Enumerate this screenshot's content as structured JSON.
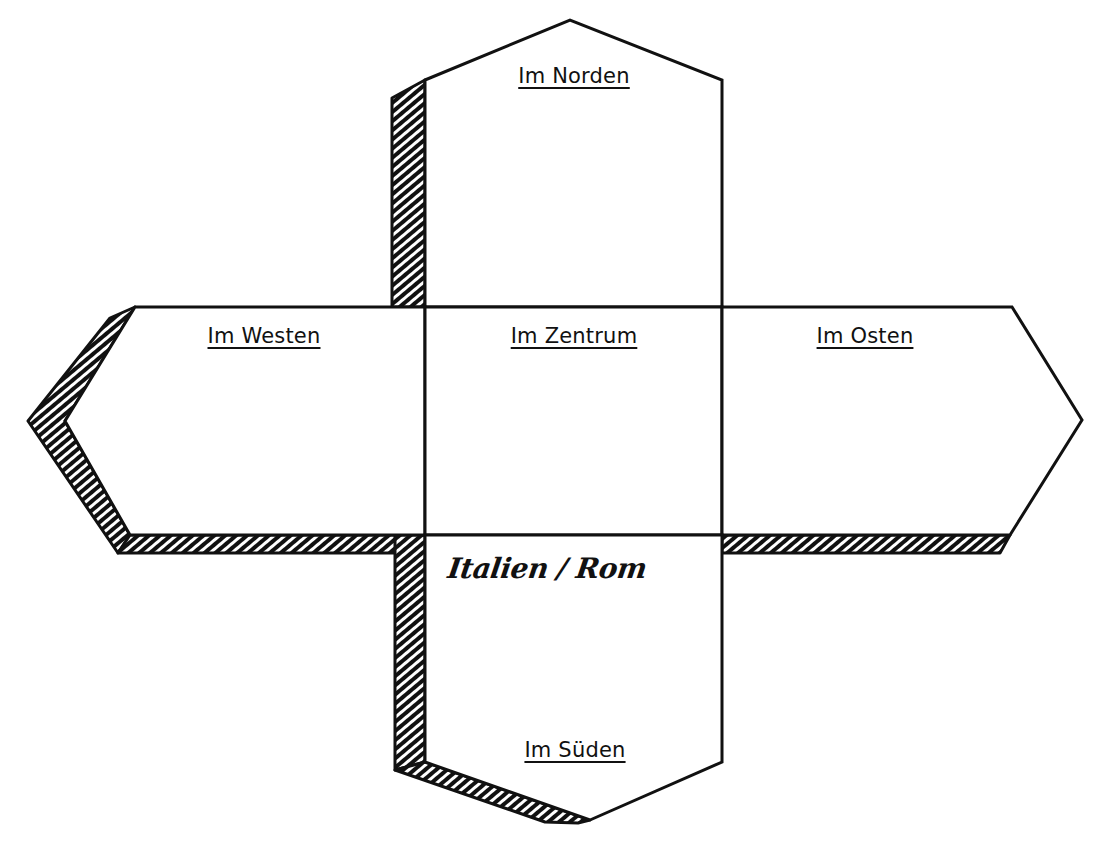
{
  "diagram": {
    "type": "folding-net",
    "colors": {
      "stroke": "#111111",
      "hatch": "#111111",
      "paper": "#ffffff"
    },
    "faces": [
      {
        "id": "north",
        "label": "Im Norden"
      },
      {
        "id": "west",
        "label": "Im Westen"
      },
      {
        "id": "center",
        "label": "Im Zentrum"
      },
      {
        "id": "east",
        "label": "Im Osten"
      },
      {
        "id": "south",
        "label": "Im Süden"
      }
    ],
    "handwritten_note": "Italien / Rom"
  }
}
